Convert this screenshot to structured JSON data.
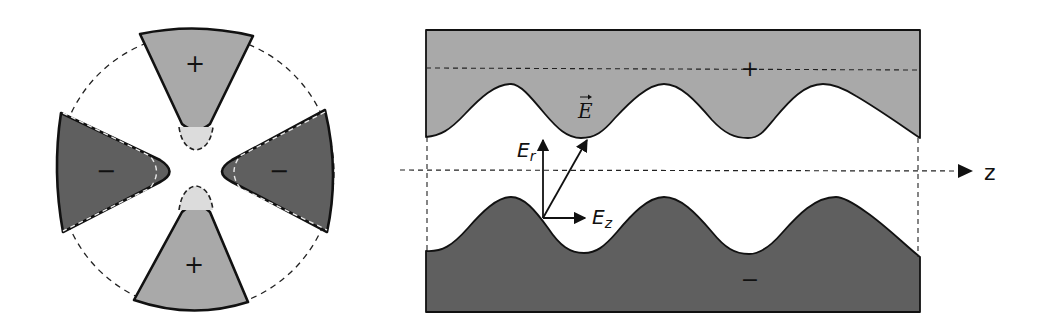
{
  "figure": {
    "left_panel": {
      "description": "Radial cross-section of quadrupole electrodes",
      "colors": {
        "positive_electrode": "#a9a9a9",
        "negative_electrode": "#5f5f5f",
        "outline": "#111111",
        "tip_cap": "#dcdcdc"
      },
      "labels": {
        "top": "+",
        "bottom": "+",
        "left": "−",
        "right": "−"
      }
    },
    "right_panel": {
      "description": "Axial section of modulated electrodes",
      "colors": {
        "upper_electrode": "#a9a9a9",
        "lower_electrode": "#5f5f5f",
        "outline": "#111111"
      },
      "labels": {
        "upper_sign": "+",
        "lower_sign": "−",
        "field_vector": "E",
        "radial_component": "E",
        "radial_subscript": "r",
        "axial_component": "E",
        "axial_subscript": "z",
        "axis": "z"
      }
    }
  }
}
